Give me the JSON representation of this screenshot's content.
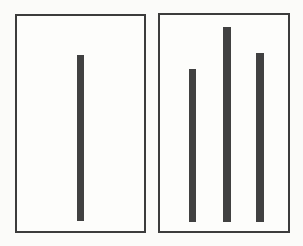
{
  "colors": {
    "page_background": "#fbfbf9",
    "card_background": "#fdfdfb",
    "card_border": "#3c3c3c",
    "bar": "#414141"
  },
  "left_card": {
    "role": "standard-line-card",
    "bars": [
      {
        "name": "standard-line",
        "left": 60,
        "top": 39,
        "width": 7,
        "height": 166
      }
    ]
  },
  "right_card": {
    "role": "comparison-lines-card",
    "bars": [
      {
        "name": "comparison-line-a",
        "left": 29,
        "top": 54,
        "width": 7,
        "height": 153
      },
      {
        "name": "comparison-line-b",
        "left": 63,
        "top": 12,
        "width": 8,
        "height": 195
      },
      {
        "name": "comparison-line-c",
        "left": 96,
        "top": 38,
        "width": 8,
        "height": 169
      }
    ]
  },
  "chart_data": {
    "type": "bar",
    "title": "",
    "series": [
      {
        "name": "standard-line",
        "card": "left",
        "height_px": 166
      },
      {
        "name": "comparison-line-a",
        "card": "right",
        "height_px": 153
      },
      {
        "name": "comparison-line-b",
        "card": "right",
        "height_px": 195
      },
      {
        "name": "comparison-line-c",
        "card": "right",
        "height_px": 169
      }
    ]
  }
}
